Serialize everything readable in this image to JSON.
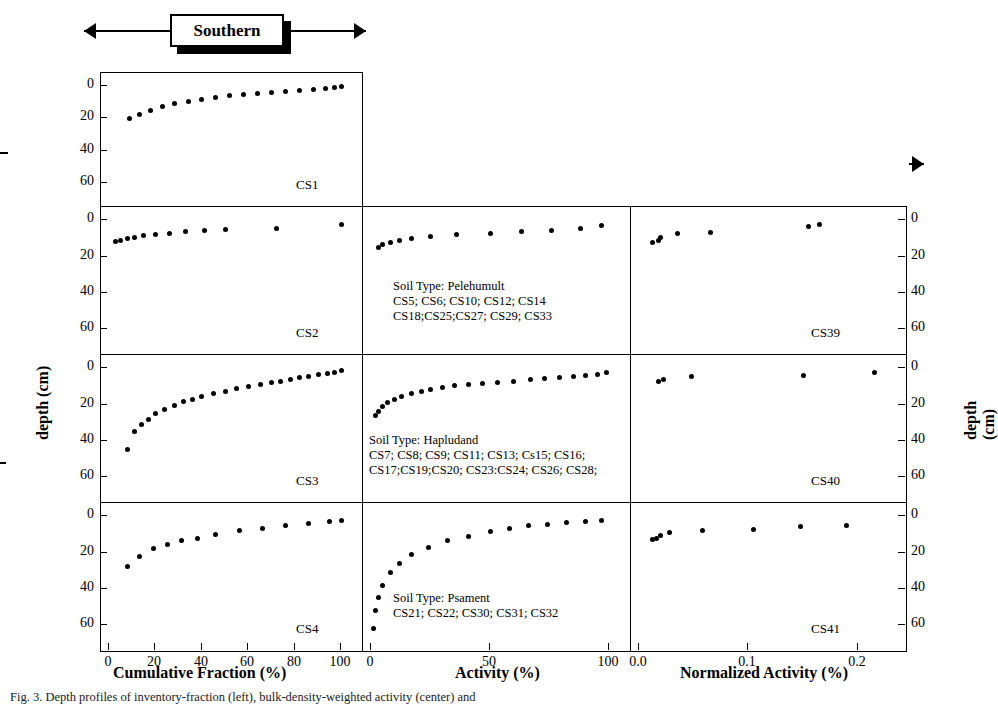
{
  "groups": [
    {
      "label": "Southern"
    },
    {
      "label": "South Central"
    },
    {
      "label": "South Patagonia"
    }
  ],
  "axes": {
    "ylabel_left": "depth (cm)",
    "ylabel_right": "depth (cm)",
    "xlabels": [
      "Cumulative Fraction (%)",
      "Activity (%)",
      "Normalized Activity (%)"
    ],
    "xticks_col1": [
      "0",
      "20",
      "40",
      "60",
      "80",
      "100"
    ],
    "xticks_col2": [
      "0",
      "50",
      "100"
    ],
    "xticks_col3": [
      "0.0",
      "0.1",
      "0.2"
    ],
    "yticks": [
      "0",
      "20",
      "40",
      "60"
    ]
  },
  "panels": {
    "labels": [
      "CS1",
      "CS2",
      "CS3",
      "CS4",
      "CS39",
      "CS40",
      "CS41"
    ],
    "soil_notes": [
      "Soil Type: Pelehumult\nCS5; CS6; CS10; CS12; CS14\nCS18;CS25;CS27; CS29; CS33",
      "Soil Type: Hapludand\nCS7; CS8; CS9; CS11; CS13; Cs15; CS16;\nCS17;CS19;CS20; CS23:CS24; CS26; CS28;",
      "Soil Type: Psament\nCS21; CS22; CS30; CS31; CS32"
    ]
  },
  "caption": "Fig. 3. Depth profiles of inventory-fraction (left), bulk-density-weighted activity (center) and",
  "chart_data": {
    "type": "scatter",
    "title": "",
    "xlabel": "Cumulative Fraction (%) / Activity (%) / Normalized Activity (%)",
    "ylabel": "depth (cm)",
    "ylim": [
      70,
      -3
    ],
    "grid": false,
    "legend_position": "none",
    "panels": [
      {
        "name": "CS1",
        "row": 0,
        "col": 0,
        "xlabel": "Cumulative Fraction (%)",
        "xlim": [
          0,
          105
        ],
        "points": [
          [
            9,
            20.5
          ],
          [
            13,
            17.5
          ],
          [
            18,
            15.0
          ],
          [
            23,
            13.0
          ],
          [
            28,
            11.2
          ],
          [
            34,
            9.5
          ],
          [
            40,
            8.2
          ],
          [
            46,
            7.0
          ],
          [
            52,
            6.2
          ],
          [
            58,
            5.3
          ],
          [
            64,
            4.6
          ],
          [
            70,
            4.0
          ],
          [
            76,
            3.4
          ],
          [
            82,
            2.8
          ],
          [
            88,
            2.2
          ],
          [
            93,
            1.6
          ],
          [
            97,
            1.1
          ],
          [
            100,
            0.6
          ]
        ]
      },
      {
        "name": "CS2",
        "row": 1,
        "col": 0,
        "xlabel": "Cumulative Fraction (%)",
        "xlim": [
          0,
          105
        ],
        "points": [
          [
            3,
            11.5
          ],
          [
            5,
            11.0
          ],
          [
            8,
            10.0
          ],
          [
            11,
            9.2
          ],
          [
            15,
            8.2
          ],
          [
            20,
            7.6
          ],
          [
            26,
            7.0
          ],
          [
            33,
            6.4
          ],
          [
            41,
            5.8
          ],
          [
            50,
            5.2
          ],
          [
            72,
            4.2
          ],
          [
            100,
            2.4
          ]
        ]
      },
      {
        "name": "CS3",
        "row": 2,
        "col": 0,
        "xlabel": "Cumulative Fraction (%)",
        "xlim": [
          0,
          105
        ],
        "points": [
          [
            8,
            45.0
          ],
          [
            11,
            35.0
          ],
          [
            14,
            31.0
          ],
          [
            17,
            28.0
          ],
          [
            20,
            25.0
          ],
          [
            24,
            22.5
          ],
          [
            28,
            20.5
          ],
          [
            32,
            18.5
          ],
          [
            36,
            17.0
          ],
          [
            40,
            15.5
          ],
          [
            45,
            14.0
          ],
          [
            50,
            12.5
          ],
          [
            55,
            11.0
          ],
          [
            60,
            10.0
          ],
          [
            65,
            9.0
          ],
          [
            70,
            8.0
          ],
          [
            74,
            7.0
          ],
          [
            78,
            6.0
          ],
          [
            82,
            5.2
          ],
          [
            86,
            4.4
          ],
          [
            90,
            3.6
          ],
          [
            94,
            2.8
          ],
          [
            97,
            2.0
          ],
          [
            100,
            1.2
          ]
        ]
      },
      {
        "name": "CS4",
        "row": 3,
        "col": 0,
        "xlabel": "Cumulative Fraction (%)",
        "xlim": [
          0,
          105
        ],
        "points": [
          [
            8,
            27.5
          ],
          [
            13,
            22.0
          ],
          [
            19,
            18.0
          ],
          [
            25,
            15.5
          ],
          [
            31,
            13.5
          ],
          [
            38,
            12.0
          ],
          [
            46,
            10.0
          ],
          [
            56,
            8.0
          ],
          [
            66,
            6.5
          ],
          [
            76,
            5.0
          ],
          [
            86,
            4.0
          ],
          [
            95,
            3.0
          ],
          [
            100,
            2.5
          ]
        ]
      },
      {
        "name": "CS5-group",
        "row": 1,
        "col": 1,
        "xlabel": "Activity (%)",
        "xlim": [
          0,
          105
        ],
        "points": [
          [
            3,
            15.0
          ],
          [
            5,
            13.5
          ],
          [
            8,
            12.0
          ],
          [
            12,
            11.0
          ],
          [
            17,
            10.0
          ],
          [
            25,
            9.0
          ],
          [
            36,
            8.0
          ],
          [
            50,
            7.0
          ],
          [
            63,
            6.3
          ],
          [
            76,
            5.6
          ],
          [
            88,
            4.3
          ],
          [
            97,
            2.6
          ]
        ]
      },
      {
        "name": "CS7-group",
        "row": 2,
        "col": 1,
        "xlabel": "Activity (%)",
        "xlim": [
          0,
          105
        ],
        "points": [
          [
            2,
            26.0
          ],
          [
            3,
            24.0
          ],
          [
            5,
            21.0
          ],
          [
            7,
            19.0
          ],
          [
            10,
            17.0
          ],
          [
            13,
            15.5
          ],
          [
            17,
            14.0
          ],
          [
            21,
            12.5
          ],
          [
            25,
            11.5
          ],
          [
            30,
            10.5
          ],
          [
            35,
            9.5
          ],
          [
            41,
            9.0
          ],
          [
            47,
            8.5
          ],
          [
            53,
            8.0
          ],
          [
            60,
            7.0
          ],
          [
            67,
            6.0
          ],
          [
            73,
            5.5
          ],
          [
            79,
            5.0
          ],
          [
            85,
            4.5
          ],
          [
            90,
            4.0
          ],
          [
            95,
            3.2
          ],
          [
            99,
            2.4
          ]
        ]
      },
      {
        "name": "CS21-group",
        "row": 3,
        "col": 1,
        "xlabel": "Activity (%)",
        "xlim": [
          0,
          105
        ],
        "points": [
          [
            1,
            62.0
          ],
          [
            2,
            52.0
          ],
          [
            3,
            45.0
          ],
          [
            5,
            38.0
          ],
          [
            8,
            31.0
          ],
          [
            12,
            26.0
          ],
          [
            17,
            21.0
          ],
          [
            24,
            17.0
          ],
          [
            32,
            13.5
          ],
          [
            41,
            11.0
          ],
          [
            50,
            8.5
          ],
          [
            58,
            6.5
          ],
          [
            66,
            5.0
          ],
          [
            74,
            4.2
          ],
          [
            82,
            3.6
          ],
          [
            90,
            3.0
          ],
          [
            97,
            2.4
          ]
        ]
      },
      {
        "name": "CS39",
        "row": 1,
        "col": 2,
        "xlabel": "Normalized Activity (%)",
        "xlim": [
          0,
          0.235
        ],
        "points": [
          [
            0.012,
            12.0
          ],
          [
            0.018,
            11.0
          ],
          [
            0.02,
            9.5
          ],
          [
            0.035,
            7.5
          ],
          [
            0.065,
            6.5
          ],
          [
            0.155,
            3.5
          ],
          [
            0.165,
            2.2
          ]
        ]
      },
      {
        "name": "CS40",
        "row": 2,
        "col": 2,
        "xlabel": "Normalized Activity (%)",
        "xlim": [
          0,
          0.235
        ],
        "points": [
          [
            0.018,
            7.0
          ],
          [
            0.022,
            6.0
          ],
          [
            0.048,
            4.5
          ],
          [
            0.15,
            4.0
          ],
          [
            0.215,
            2.5
          ]
        ]
      },
      {
        "name": "CS41",
        "row": 3,
        "col": 2,
        "xlabel": "Normalized Activity (%)",
        "xlim": [
          0,
          0.235
        ],
        "points": [
          [
            0.012,
            13.0
          ],
          [
            0.016,
            12.0
          ],
          [
            0.02,
            10.5
          ],
          [
            0.028,
            9.0
          ],
          [
            0.058,
            8.0
          ],
          [
            0.105,
            7.5
          ],
          [
            0.148,
            5.5
          ],
          [
            0.19,
            5.0
          ]
        ]
      }
    ]
  }
}
